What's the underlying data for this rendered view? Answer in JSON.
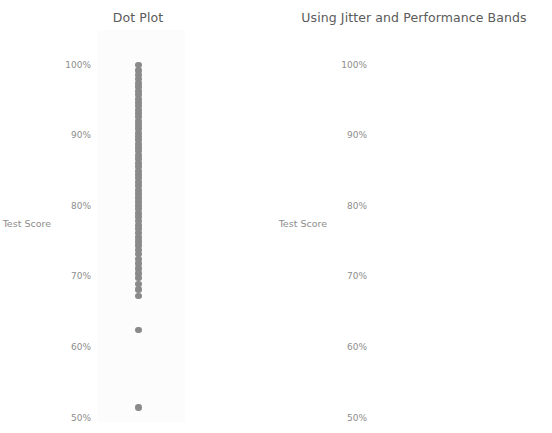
{
  "panels": [
    {
      "id": "dot-plot",
      "title": "Dot Plot",
      "axis_label": "Test Score"
    },
    {
      "id": "jitter-plot",
      "title": "Using Jitter and Performance Bands",
      "axis_label": "Test Score"
    }
  ],
  "ticks": [
    "100%",
    "90%",
    "80%",
    "70%",
    "60%",
    "50%"
  ],
  "colors": {
    "dot": "#808080",
    "title_text": "#5a5a5a",
    "axis_text": "#8d8d8d",
    "band_high": "#eeeeee",
    "band_mid": "#d6d6d6",
    "band_low": "#bdbdbd",
    "plot_background": "#fcfcfc"
  },
  "chart_data": [
    {
      "type": "scatter",
      "title": "Dot Plot",
      "xlabel": "",
      "ylabel": "Test Score",
      "ylim": [
        50,
        100
      ],
      "yticks": [
        50,
        60,
        70,
        80,
        90,
        100
      ],
      "ytick_labels": [
        "50%",
        "60%",
        "70%",
        "80%",
        "90%",
        "100%"
      ],
      "grid": false,
      "legend": false,
      "note": "Single-column strip plot; all points share one x position so many overlap.",
      "values": [
        100.0,
        99.2,
        98.6,
        98.0,
        97.4,
        96.9,
        96.3,
        95.8,
        95.2,
        94.7,
        94.2,
        93.6,
        93.1,
        92.6,
        92.0,
        91.5,
        91.0,
        90.4,
        89.9,
        89.4,
        88.8,
        88.3,
        87.8,
        87.2,
        86.7,
        86.1,
        85.6,
        85.0,
        84.5,
        84.0,
        83.4,
        82.9,
        82.3,
        81.8,
        81.2,
        80.7,
        80.1,
        79.6,
        79.0,
        78.5,
        77.9,
        77.3,
        76.8,
        76.2,
        75.6,
        75.0,
        74.4,
        73.8,
        73.2,
        72.5,
        71.9,
        71.2,
        70.5,
        69.8,
        69.0,
        68.2,
        67.3,
        62.5,
        51.5
      ]
    },
    {
      "type": "scatter",
      "title": "Using Jitter and Performance Bands",
      "xlabel": "",
      "ylabel": "Test Score",
      "ylim": [
        50,
        100
      ],
      "yticks": [
        50,
        60,
        70,
        80,
        90,
        100
      ],
      "ytick_labels": [
        "50%",
        "60%",
        "70%",
        "80%",
        "90%",
        "100%"
      ],
      "grid": false,
      "legend": false,
      "note": "Same distribution with horizontal jitter; shaded performance bands behind points.",
      "bands": [
        {
          "label": "70-80",
          "from": 70,
          "to": 80,
          "color": "#eeeeee"
        },
        {
          "label": "60-70",
          "from": 60,
          "to": 70,
          "color": "#d6d6d6"
        },
        {
          "label": "50-60",
          "from": 50,
          "to": 60,
          "color": "#bdbdbd"
        }
      ],
      "points": [
        {
          "jitter": 0.63,
          "value": 100.0
        },
        {
          "jitter": 0.87,
          "value": 99.0
        },
        {
          "jitter": 0.21,
          "value": 98.2
        },
        {
          "jitter": 0.97,
          "value": 98.6
        },
        {
          "jitter": 0.76,
          "value": 97.6
        },
        {
          "jitter": 0.57,
          "value": 97.4
        },
        {
          "jitter": 0.37,
          "value": 96.6
        },
        {
          "jitter": 0.92,
          "value": 95.8
        },
        {
          "jitter": 0.84,
          "value": 95.4
        },
        {
          "jitter": 0.96,
          "value": 94.8
        },
        {
          "jitter": 0.14,
          "value": 94.2
        },
        {
          "jitter": 0.17,
          "value": 93.8
        },
        {
          "jitter": 0.12,
          "value": 93.4
        },
        {
          "jitter": 0.79,
          "value": 93.6
        },
        {
          "jitter": 0.82,
          "value": 93.4
        },
        {
          "jitter": 0.85,
          "value": 93.2
        },
        {
          "jitter": 0.88,
          "value": 93.5
        },
        {
          "jitter": 0.25,
          "value": 92.6
        },
        {
          "jitter": 0.42,
          "value": 92.8
        },
        {
          "jitter": 0.8,
          "value": 92.2
        },
        {
          "jitter": 0.9,
          "value": 91.6
        },
        {
          "jitter": 0.56,
          "value": 90.2
        },
        {
          "jitter": 0.36,
          "value": 90.0
        },
        {
          "jitter": 0.67,
          "value": 89.4
        },
        {
          "jitter": 0.86,
          "value": 89.6
        },
        {
          "jitter": 0.93,
          "value": 88.8
        },
        {
          "jitter": 0.7,
          "value": 88.6
        },
        {
          "jitter": 0.83,
          "value": 88.2
        },
        {
          "jitter": 0.55,
          "value": 87.2
        },
        {
          "jitter": 0.6,
          "value": 87.0
        },
        {
          "jitter": 0.62,
          "value": 87.2
        },
        {
          "jitter": 0.9,
          "value": 86.8
        },
        {
          "jitter": 0.49,
          "value": 86.4
        },
        {
          "jitter": 0.46,
          "value": 85.6
        },
        {
          "jitter": 0.5,
          "value": 85.2
        },
        {
          "jitter": 0.51,
          "value": 85.0
        },
        {
          "jitter": 0.22,
          "value": 84.6
        },
        {
          "jitter": 0.68,
          "value": 84.4
        },
        {
          "jitter": 0.93,
          "value": 84.2
        },
        {
          "jitter": 0.24,
          "value": 83.0
        },
        {
          "jitter": 0.1,
          "value": 82.4
        },
        {
          "jitter": 0.56,
          "value": 82.2
        },
        {
          "jitter": 0.64,
          "value": 82.6
        },
        {
          "jitter": 0.57,
          "value": 81.8
        },
        {
          "jitter": 0.58,
          "value": 81.6
        },
        {
          "jitter": 0.18,
          "value": 80.2
        },
        {
          "jitter": 0.31,
          "value": 80.4
        },
        {
          "jitter": 0.59,
          "value": 80.2
        },
        {
          "jitter": 0.78,
          "value": 80.0
        },
        {
          "jitter": 0.14,
          "value": 79.4
        },
        {
          "jitter": 0.6,
          "value": 79.0
        },
        {
          "jitter": 0.7,
          "value": 79.2
        },
        {
          "jitter": 0.72,
          "value": 79.4
        },
        {
          "jitter": 0.3,
          "value": 78.4
        },
        {
          "jitter": 0.09,
          "value": 76.8
        },
        {
          "jitter": 0.21,
          "value": 76.4
        },
        {
          "jitter": 0.47,
          "value": 76.8
        },
        {
          "jitter": 0.61,
          "value": 76.2
        },
        {
          "jitter": 0.86,
          "value": 76.6
        },
        {
          "jitter": 0.94,
          "value": 74.6
        },
        {
          "jitter": 0.82,
          "value": 73.8
        },
        {
          "jitter": 0.18,
          "value": 71.4
        },
        {
          "jitter": 0.58,
          "value": 71.4
        },
        {
          "jitter": 0.75,
          "value": 71.0
        },
        {
          "jitter": 0.84,
          "value": 71.2
        },
        {
          "jitter": 0.91,
          "value": 71.0
        },
        {
          "jitter": 0.13,
          "value": 69.6
        },
        {
          "jitter": 0.89,
          "value": 69.4
        },
        {
          "jitter": 0.46,
          "value": 68.6
        },
        {
          "jitter": 0.66,
          "value": 67.8
        },
        {
          "jitter": 0.49,
          "value": 62.4
        },
        {
          "jitter": 0.88,
          "value": 51.4
        }
      ]
    }
  ]
}
